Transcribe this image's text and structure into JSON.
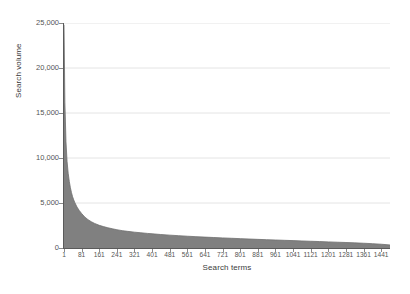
{
  "chart_data": {
    "type": "area",
    "title": "",
    "subtitle": "",
    "xlabel": "Search terms",
    "ylabel": "Search volume",
    "grid": true,
    "legend": false,
    "legend_position": "none",
    "series_color": "#808080",
    "gridline_color": "#e4e4e4",
    "axis_color": "#5a5a5a",
    "background": "#ffffff",
    "xlim": [
      1,
      1481
    ],
    "ylim": [
      0,
      25000
    ],
    "y_ticks": [
      0,
      5000,
      10000,
      15000,
      20000,
      25000
    ],
    "y_tick_labels": [
      "0",
      "5,000",
      "10,000",
      "15,000",
      "20,000",
      "25,000"
    ],
    "x_ticks": [
      1,
      81,
      161,
      241,
      321,
      401,
      481,
      561,
      641,
      721,
      801,
      881,
      961,
      1041,
      1121,
      1201,
      1281,
      1361,
      1441
    ],
    "x_tick_labels": [
      "1",
      "81",
      "161",
      "241",
      "321",
      "401",
      "481",
      "561",
      "641",
      "721",
      "801",
      "881",
      "961",
      "1041",
      "1121",
      "1201",
      "1281",
      "1361",
      "1441"
    ],
    "x": [
      1,
      5,
      10,
      15,
      20,
      25,
      30,
      35,
      40,
      45,
      50,
      60,
      70,
      81,
      95,
      110,
      125,
      140,
      161,
      180,
      200,
      220,
      241,
      265,
      290,
      321,
      350,
      380,
      401,
      440,
      481,
      520,
      561,
      600,
      641,
      681,
      721,
      761,
      801,
      841,
      881,
      921,
      961,
      1001,
      1041,
      1081,
      1121,
      1161,
      1201,
      1241,
      1281,
      1321,
      1361,
      1401,
      1441,
      1481
    ],
    "values": [
      24800,
      16200,
      11800,
      9600,
      8300,
      7400,
      6700,
      6150,
      5700,
      5350,
      5050,
      4550,
      4180,
      3830,
      3450,
      3150,
      2920,
      2730,
      2520,
      2380,
      2250,
      2140,
      2030,
      1930,
      1850,
      1760,
      1690,
      1620,
      1580,
      1500,
      1430,
      1370,
      1310,
      1260,
      1210,
      1165,
      1120,
      1080,
      1040,
      1000,
      960,
      925,
      890,
      855,
      820,
      785,
      750,
      715,
      680,
      645,
      610,
      570,
      530,
      480,
      420,
      340
    ]
  },
  "axis_titles": {
    "x": "Search terms",
    "y": "Search volume"
  }
}
